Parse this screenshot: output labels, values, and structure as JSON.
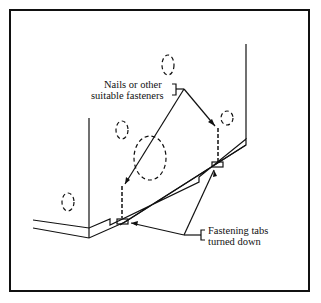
{
  "diagram": {
    "labels": {
      "fasteners_line1": "Nails or other",
      "fasteners_line2": "suitable fasteners",
      "tabs_line1": "Fastening tabs",
      "tabs_line2": "turned down"
    },
    "colors": {
      "ink": "#111111",
      "background": "#ffffff"
    }
  }
}
